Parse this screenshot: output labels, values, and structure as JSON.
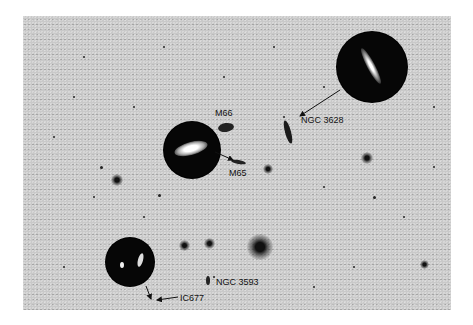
{
  "image": {
    "description": "Inverted grayscale astronomical field of the Leo Triplet with circular inset views of galaxies",
    "labels": [
      {
        "id": "m66",
        "text": "M66"
      },
      {
        "id": "m65",
        "text": "M65"
      },
      {
        "id": "ngc3628",
        "text": "NGC 3628"
      },
      {
        "id": "ngc3593",
        "text": "NGC 3593"
      },
      {
        "id": "ic677",
        "text": "IC677"
      }
    ],
    "colors": {
      "background": "#ffffff",
      "sky": "#c9c9c9",
      "inset": "#060606",
      "label": "#111111"
    }
  }
}
